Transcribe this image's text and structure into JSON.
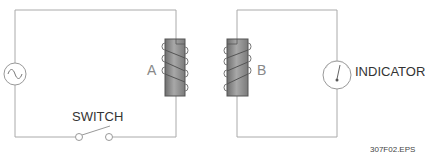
{
  "diagram": {
    "labels": {
      "coil_a": "A",
      "coil_b": "B",
      "switch": "SWITCH",
      "indicator": "INDICATOR",
      "file_id": "307F02.EPS"
    },
    "components": {
      "primary_circuit": [
        "ac-source",
        "coil-a",
        "switch"
      ],
      "secondary_circuit": [
        "coil-b",
        "indicator"
      ]
    },
    "colors": {
      "wire": "#aaaaaa",
      "core": "#8a8a8a",
      "core_edge": "#555555",
      "text": "#333333"
    }
  }
}
